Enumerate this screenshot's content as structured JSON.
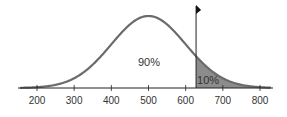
{
  "chart_data": {
    "type": "area",
    "title": "",
    "xlabel": "",
    "ylabel": "",
    "distribution": "normal",
    "mean": 500,
    "sd": 100,
    "cutoff": 628,
    "xlim": [
      155,
      830
    ],
    "x_ticks": [
      200,
      300,
      400,
      500,
      600,
      700,
      800
    ],
    "tick_labels": [
      "200",
      "300",
      "400",
      "500",
      "600",
      "700",
      "800"
    ],
    "regions": [
      {
        "name": "below-cutoff",
        "label": "90%",
        "value": 90,
        "shaded": false
      },
      {
        "name": "above-cutoff",
        "label": "10%",
        "value": 10,
        "shaded": true
      }
    ],
    "grid": false,
    "legend": null,
    "annotations": [
      {
        "type": "flag-marker",
        "x": 628
      }
    ]
  },
  "colors": {
    "curve": "#6b6b6b",
    "shade": "#8c8c8c",
    "axis": "#222222"
  }
}
